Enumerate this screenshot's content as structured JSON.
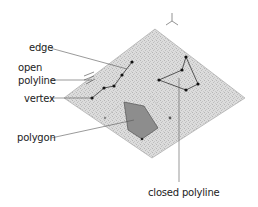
{
  "labels": {
    "edge": "edge",
    "open_line1": "open",
    "open_line2": "polyline",
    "vertex": "vertex",
    "polygon": "polygon",
    "closed_polyline": "closed polyline"
  },
  "colors": {
    "plane_fill": "#d9d9d9",
    "plane_edge": "#9a9a9a",
    "polygon_fill": "#8a8a8a",
    "line": "#333333",
    "leader": "#555555",
    "vertex": "#111111"
  }
}
